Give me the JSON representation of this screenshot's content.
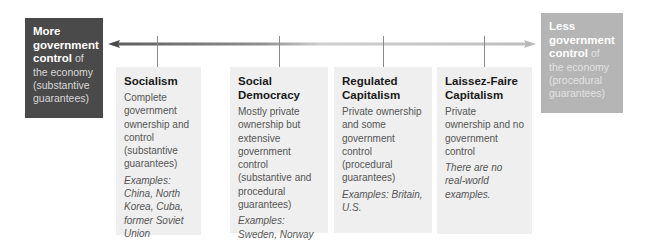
{
  "left_end": {
    "bold": "More government control",
    "rest": " of the economy (substantive guarantees)"
  },
  "right_end": {
    "bold": "Less government control",
    "rest": " of the economy (procedural guarantees)"
  },
  "arrow": {
    "left_color": "#6a6a6a",
    "right_color": "#bdbdbd",
    "direction": "bidirectional"
  },
  "cards": [
    {
      "title": "Socialism",
      "description": "Complete government ownership and control (substantive guarantees)",
      "examples": "Examples: China, North Korea, Cuba, former Soviet Union"
    },
    {
      "title": "Social Democracy",
      "description": "Mostly private ownership but extensive government control (substantive and procedural guarantees)",
      "examples": "Examples: Sweden, Norway"
    },
    {
      "title": "Regulated Capitalism",
      "description": "Private ownership and some government control (procedural guarantees)",
      "examples": "Examples: Britain, U.S."
    },
    {
      "title": "Laissez-Faire Capitalism",
      "description": "Private ownership and no government control",
      "examples": "There are no real-world examples."
    }
  ]
}
